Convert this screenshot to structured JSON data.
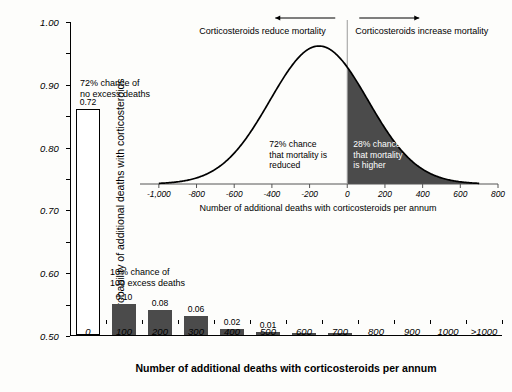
{
  "chart_data": {
    "type": "bar",
    "title": "",
    "xlabel": "Number of additional deaths with corticosteroids per annum",
    "ylabel": "Probability of additional deaths with corticosteroids",
    "categories": [
      "0",
      "100",
      "200",
      "300",
      "400",
      "500",
      "600",
      "700",
      "800",
      "900",
      "1000",
      ">1000"
    ],
    "values": [
      0.72,
      0.1,
      0.08,
      0.06,
      0.02,
      0.01,
      0.005,
      0.004,
      0,
      0,
      0,
      0
    ],
    "value_labels": [
      "0.72",
      "0.10",
      "0.08",
      "0.06",
      "0.02",
      "0.01",
      "",
      "",
      "",
      "",
      "",
      ""
    ],
    "ylim": [
      0,
      1.0
    ],
    "ytick_labels": [
      "0.00",
      "0.10",
      "0.20",
      "0.30",
      "0.40",
      "0.50",
      "0.60",
      "0.70",
      "0.80",
      "0.90",
      "1.00"
    ],
    "ytick_values": [
      0,
      0.1,
      0.2,
      0.3,
      0.4,
      0.5,
      0.6,
      0.7,
      0.8,
      0.9,
      1.0
    ],
    "grid": false,
    "legend": "none",
    "bar_colors": [
      "#ffffff",
      "#4b4b4b",
      "#4b4b4b",
      "#4b4b4b",
      "#4b4b4b",
      "#4b4b4b",
      "#4b4b4b",
      "#4b4b4b",
      "#4b4b4b",
      "#4b4b4b",
      "#4b4b4b",
      "#4b4b4b"
    ],
    "annotations": [
      {
        "text": "72% chance of\nno excess deaths",
        "category": "0"
      },
      {
        "text": "10% chance of\n100 excess deaths",
        "category": "100"
      }
    ],
    "inset": {
      "type": "area",
      "xlabel": "Number of additional deaths with corticosteroids per annum",
      "ylabel": "",
      "xlim": [
        -1100,
        800
      ],
      "xtick_labels": [
        "-1,000",
        "-800",
        "-600",
        "-400",
        "-200",
        "0",
        "200",
        "400",
        "600",
        "800"
      ],
      "xtick_values": [
        -1000,
        -800,
        -600,
        -400,
        -200,
        0,
        200,
        400,
        600,
        800
      ],
      "distribution": {
        "kind": "normal",
        "mean": -150,
        "sd": 260,
        "shaded_from": 0,
        "shaded_to": 800
      },
      "shade_color": "#4b4b4b",
      "curve_color": "#000000",
      "headers": [
        {
          "text": "Corticosteroids reduce mortality",
          "arrow": "left"
        },
        {
          "text": "Corticosteroids increase mortality",
          "arrow": "right"
        }
      ],
      "annotations": [
        {
          "text": "72% chance\nthat mortality is\nreduced",
          "color": "#000000"
        },
        {
          "text": "28% chance\nthat mortality\nis higher",
          "color": "#ffffff"
        }
      ]
    }
  },
  "main": {
    "y_axis_title": "Probability of additional deaths with corticosteroids",
    "x_axis_title": "Number of additional deaths with corticosteroids per annum",
    "note_left": "72% chance of\nno excess deaths",
    "note_mid": "10% chance of\n100 excess deaths"
  },
  "inset": {
    "x_axis_title": "Number of additional deaths with corticosteroids per annum",
    "header_left": "Corticosteroids reduce mortality",
    "header_right": "Corticosteroids increase mortality",
    "note_left": "72% chance\nthat mortality is\nreduced",
    "note_right": "28% chance\nthat mortality\nis higher"
  }
}
